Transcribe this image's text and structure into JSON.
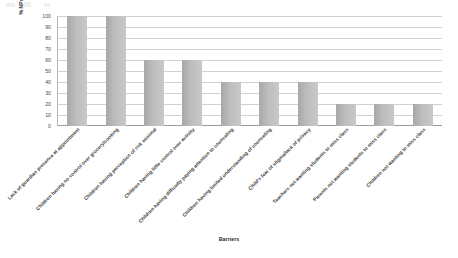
{
  "chart_data": {
    "type": "bar",
    "title": "",
    "xlabel": "Barriers",
    "ylabel": "% NPs That Agree That Each is Barrier",
    "ylim": [
      0,
      100
    ],
    "grid": true,
    "legend": "none",
    "categories": [
      "Lack of guardian presence at appointment",
      "Children having no control over grocery/cooking",
      "Children having perception of risk minimal",
      "Children having little control over activity",
      "Children having difficulty paying attention to counseling",
      "Children having limited understanding of counseling",
      "Child's fear of stigma/lack of privacy",
      "Teachers not wanting students to miss class",
      "Parents not wanting students to miss class",
      "Children not wanting to miss class"
    ],
    "values": [
      100,
      100,
      60,
      60,
      40,
      40,
      40,
      20,
      20,
      20
    ],
    "yticks": [
      "100",
      "90",
      "80",
      "70",
      "60",
      "50",
      "40",
      "30",
      "20",
      "10",
      "0"
    ],
    "bar_color": "#bdbdbd"
  }
}
